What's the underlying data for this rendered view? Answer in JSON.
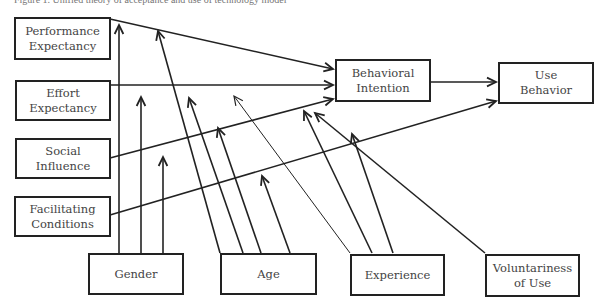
{
  "caption": "Figure 1. Unified theory of acceptance and use of technology model",
  "nodes": {
    "performance_expectancy": {
      "label": "Performance\nExpectancy",
      "x": 14,
      "y": 17,
      "w": 97,
      "h": 43
    },
    "effort_expectancy": {
      "label": "Effort\nExpectancy",
      "x": 15,
      "y": 80,
      "w": 96,
      "h": 41
    },
    "social_influence": {
      "label": "Social\nInfluence",
      "x": 15,
      "y": 138,
      "w": 96,
      "h": 41
    },
    "facilitating_conditions": {
      "label": "Facilitating\nConditions",
      "x": 14,
      "y": 196,
      "w": 97,
      "h": 41
    },
    "behavioral_intention": {
      "label": "Behavioral\nIntention",
      "x": 335,
      "y": 59,
      "w": 96,
      "h": 43
    },
    "use_behavior": {
      "label": "Use\nBehavior",
      "x": 498,
      "y": 62,
      "w": 96,
      "h": 42
    },
    "gender": {
      "label": "Gender",
      "x": 88,
      "y": 253,
      "w": 96,
      "h": 42
    },
    "age": {
      "label": "Age",
      "x": 220,
      "y": 253,
      "w": 97,
      "h": 42
    },
    "experience": {
      "label": "Experience",
      "x": 350,
      "y": 254,
      "w": 95,
      "h": 42
    },
    "voluntariness_of_use": {
      "label": "Voluntariness\nof Use",
      "x": 485,
      "y": 254,
      "w": 95,
      "h": 43
    }
  },
  "edges": [
    {
      "from": "performance_expectancy",
      "to": "behavioral_intention",
      "x1": 110,
      "y1": 19,
      "x2": 333,
      "y2": 69
    },
    {
      "from": "effort_expectancy",
      "to": "behavioral_intention",
      "x1": 110,
      "y1": 85,
      "x2": 333,
      "y2": 85
    },
    {
      "from": "social_influence",
      "to": "behavioral_intention",
      "x1": 110,
      "y1": 158,
      "x2": 333,
      "y2": 99
    },
    {
      "from": "facilitating_conditions",
      "to": "use_behavior",
      "x1": 110,
      "y1": 215,
      "x2": 496,
      "y2": 101
    },
    {
      "from": "behavioral_intention",
      "to": "use_behavior",
      "x1": 431,
      "y1": 82,
      "x2": 496,
      "y2": 82
    }
  ],
  "moderators": [
    {
      "from": "gender",
      "x1": 119,
      "y1": 253,
      "x2": 119,
      "y2": 25,
      "thin": false
    },
    {
      "from": "gender",
      "x1": 141,
      "y1": 253,
      "x2": 141,
      "y2": 97,
      "thin": false
    },
    {
      "from": "gender",
      "x1": 163,
      "y1": 253,
      "x2": 163,
      "y2": 157,
      "thin": false
    },
    {
      "from": "age",
      "x1": 220,
      "y1": 253,
      "x2": 158,
      "y2": 31,
      "thin": false
    },
    {
      "from": "age",
      "x1": 243,
      "y1": 253,
      "x2": 189,
      "y2": 98,
      "thin": false
    },
    {
      "from": "age",
      "x1": 261,
      "y1": 253,
      "x2": 218,
      "y2": 128,
      "thin": false
    },
    {
      "from": "age",
      "x1": 290,
      "y1": 253,
      "x2": 262,
      "y2": 176,
      "thin": false
    },
    {
      "from": "experience",
      "x1": 350,
      "y1": 253,
      "x2": 234,
      "y2": 96,
      "thin": true
    },
    {
      "from": "experience",
      "x1": 372,
      "y1": 253,
      "x2": 304,
      "y2": 111,
      "thin": false
    },
    {
      "from": "experience",
      "x1": 393,
      "y1": 253,
      "x2": 352,
      "y2": 134,
      "thin": false
    },
    {
      "from": "voluntariness_of_use",
      "x1": 485,
      "y1": 253,
      "x2": 315,
      "y2": 113,
      "thin": false
    }
  ],
  "colors": {
    "line": "#222222",
    "text": "#444444",
    "background": "#ffffff"
  }
}
